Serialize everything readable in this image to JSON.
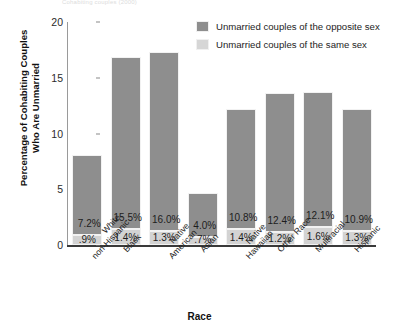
{
  "top_remnant_text": "Cohabiting couples (2000)",
  "legend": {
    "position": "top-right",
    "entries": [
      {
        "label": "Unmarried couples of the opposite sex",
        "color": "#8e8e8e",
        "key": "opp"
      },
      {
        "label": "Unmarried couples of the same sex",
        "color": "#d6d6d6",
        "key": "same"
      }
    ]
  },
  "chart_data": {
    "type": "bar",
    "stacked": true,
    "title": "",
    "xlabel": "Race",
    "ylabel": "Percentage of Cohabiting Couples Who Are Unmarried",
    "ylabel_lines": [
      "Percentage of Cohabiting Couples",
      "Who Are Unmarried"
    ],
    "ylim": [
      0,
      20
    ],
    "yticks": [
      0,
      5,
      10,
      15,
      20
    ],
    "ytick_labels": [
      "0",
      "5",
      "10",
      "15",
      "20"
    ],
    "grid": false,
    "legend_position": "top-right",
    "categories": [
      "White, non-Hispanic",
      "Black",
      "Native American",
      "Asian",
      "Native Hawaiian",
      "Other Race",
      "Multiracial",
      "Hispanic"
    ],
    "category_lines": [
      [
        "White,",
        "non-Hispanic"
      ],
      [
        "Black"
      ],
      [
        "Native",
        "American"
      ],
      [
        "Asian"
      ],
      [
        "Native",
        "Hawaiian"
      ],
      [
        "Other Race"
      ],
      [
        "Multiracial"
      ],
      [
        "Hispanic"
      ]
    ],
    "series": [
      {
        "name": "Unmarried couples of the same sex",
        "color": "#d3d3d3",
        "values": [
          0.9,
          1.4,
          1.3,
          0.7,
          1.4,
          1.2,
          1.6,
          1.3
        ],
        "labels": [
          ".9%",
          "1.4%",
          "1.3%",
          ".7%",
          "1.4%",
          "1.2%",
          "1.6%",
          "1.3%"
        ]
      },
      {
        "name": "Unmarried couples of the opposite sex",
        "color": "#8e8e8e",
        "values": [
          7.2,
          15.5,
          16.0,
          4.0,
          10.8,
          12.4,
          12.1,
          10.9
        ],
        "labels": [
          "7.2%",
          "15.5%",
          "16.0%",
          "4.0%",
          "10.8%",
          "12.4%",
          "12.1%",
          "10.9%"
        ]
      }
    ],
    "totals": [
      8.1,
      16.9,
      17.3,
      4.7,
      12.2,
      13.6,
      13.7,
      12.2
    ]
  }
}
